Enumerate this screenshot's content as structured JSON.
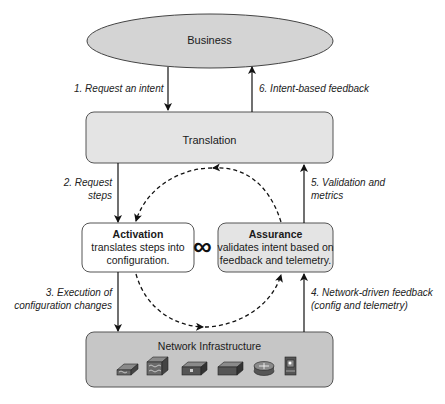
{
  "diagram": {
    "nodes": {
      "business": {
        "label": "Business"
      },
      "translation": {
        "label": "Translation"
      },
      "activation": {
        "title": "Activation",
        "line1": "translates steps into",
        "line2": "configuration."
      },
      "assurance": {
        "title": "Assurance",
        "line1": "validates intent based on",
        "line2": "feedback and telemetry."
      },
      "network": {
        "label": "Network Infrastructure",
        "devices": [
          "layer3-switch-icon",
          "multilayer-switch-icon",
          "firewall-switch-icon",
          "switch-icon",
          "router-icon",
          "server-icon"
        ]
      }
    },
    "edges": {
      "e1": {
        "label": "1. Request an intent"
      },
      "e2": {
        "line1": "2. Request",
        "line2": "steps"
      },
      "e3": {
        "line1": "3. Execution of",
        "line2": "configuration changes"
      },
      "e4": {
        "line1": "4. Network-driven feedback",
        "line2": "(config and telemetry)"
      },
      "e5": {
        "line1": "5. Validation and",
        "line2": "metrics"
      },
      "e6": {
        "label": "6. Intent-based feedback"
      }
    },
    "loop_symbol": "∞",
    "colors": {
      "business_fill": "#d4d4d4",
      "translation_fill": "#e4e4e4",
      "activation_fill": "#ffffff",
      "assurance_fill": "#e4e4e4",
      "network_fill": "#c6c6c6",
      "stroke": "#333333"
    }
  }
}
